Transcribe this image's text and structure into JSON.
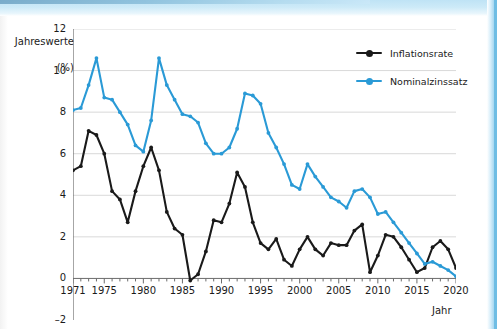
{
  "figure": {
    "ylabel_line1": "Jahreswerte",
    "ylabel_line2": "(%)",
    "xlabel": "Jahr"
  },
  "legend": {
    "position": "top-right",
    "items": [
      {
        "label": "Inflationsrate",
        "color": "#1a1a1a",
        "marker": "circle"
      },
      {
        "label": "Nominalzinssatz",
        "color": "#2a9ad6",
        "marker": "circle"
      }
    ]
  },
  "colors": {
    "inflation": "#1a1a1a",
    "nominal": "#2a9ad6",
    "grid": "#d9d9d9",
    "axis": "#6b6b6b",
    "text": "#1a1a1a",
    "scan_blue": "#7cc5e9"
  },
  "chart_data": {
    "type": "line",
    "title": "",
    "xlabel": "Jahr",
    "ylabel": "Jahreswerte (%)",
    "xlim": [
      1971,
      2020
    ],
    "ylim": [
      -2,
      12
    ],
    "yticks": [
      -2,
      0,
      2,
      4,
      6,
      8,
      10,
      12
    ],
    "xticks_major": [
      1971,
      1975,
      1980,
      1985,
      1990,
      1995,
      2000,
      2005,
      2010,
      2015,
      2020
    ],
    "xtick_step_minor": 1,
    "grid": "horizontal",
    "legend_position": "upper right",
    "x": [
      1971,
      1972,
      1973,
      1974,
      1975,
      1976,
      1977,
      1978,
      1979,
      1980,
      1981,
      1982,
      1983,
      1984,
      1985,
      1986,
      1987,
      1988,
      1989,
      1990,
      1991,
      1992,
      1993,
      1994,
      1995,
      1996,
      1997,
      1998,
      1999,
      2000,
      2001,
      2002,
      2003,
      2004,
      2005,
      2006,
      2007,
      2008,
      2009,
      2010,
      2011,
      2012,
      2013,
      2014,
      2015,
      2016,
      2017,
      2018,
      2019,
      2020
    ],
    "series": [
      {
        "name": "Inflationsrate",
        "color": "#1a1a1a",
        "values": [
          5.2,
          5.4,
          7.1,
          6.9,
          6.0,
          4.2,
          3.8,
          2.7,
          4.2,
          5.4,
          6.3,
          5.2,
          3.2,
          2.4,
          2.1,
          -0.1,
          0.2,
          1.3,
          2.8,
          2.7,
          3.6,
          5.1,
          4.4,
          2.7,
          1.7,
          1.4,
          1.9,
          0.9,
          0.6,
          1.4,
          2.0,
          1.4,
          1.1,
          1.7,
          1.6,
          1.6,
          2.3,
          2.6,
          0.3,
          1.1,
          2.1,
          2.0,
          1.5,
          0.9,
          0.3,
          0.5,
          1.5,
          1.8,
          1.4,
          0.5
        ]
      },
      {
        "name": "Nominalzinssatz",
        "color": "#2a9ad6",
        "values": [
          8.1,
          8.2,
          9.3,
          10.6,
          8.7,
          8.6,
          8.0,
          7.4,
          6.4,
          6.1,
          7.6,
          10.6,
          9.3,
          8.6,
          7.9,
          7.8,
          7.5,
          6.5,
          6.0,
          6.0,
          6.3,
          7.2,
          8.9,
          8.8,
          8.4,
          7.0,
          6.3,
          5.5,
          4.5,
          4.3,
          5.5,
          4.9,
          4.4,
          3.9,
          3.7,
          3.4,
          4.2,
          4.3,
          3.9,
          3.1,
          3.2,
          2.7,
          2.2,
          1.7,
          1.2,
          0.7,
          0.8,
          0.6,
          0.4,
          0.1
        ]
      }
    ]
  }
}
